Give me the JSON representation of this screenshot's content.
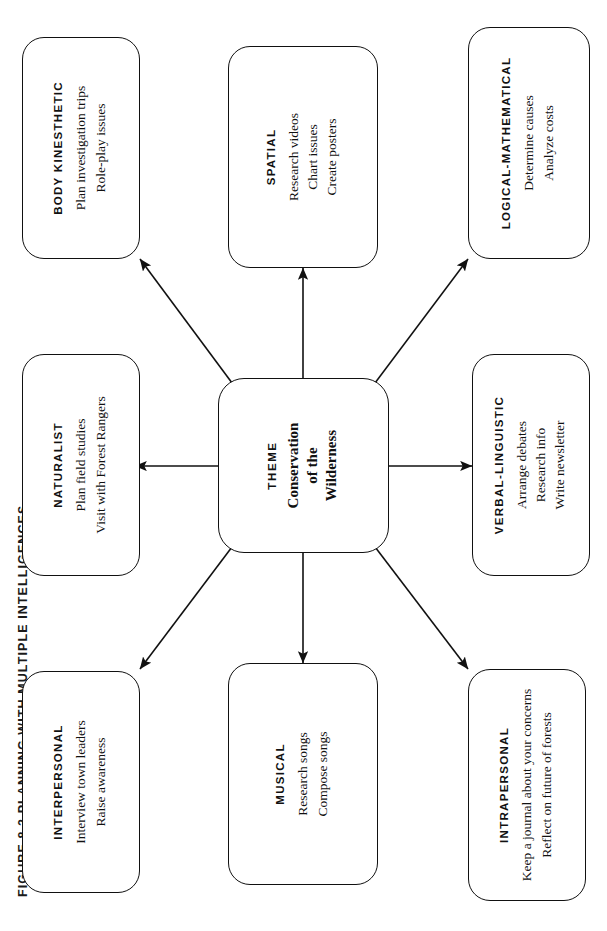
{
  "figure": {
    "title": "FIGURE 8.2  PLANNING WITH MULTIPLE INTELLIGENCES"
  },
  "theme": {
    "label": "THEME",
    "title_lines": [
      "Conservation",
      "of the",
      "Wilderness"
    ],
    "title": "Conservation of the Wilderness"
  },
  "colors": {
    "stroke": "#111111",
    "background": "#ffffff",
    "text": "#111111"
  },
  "nodes": [
    {
      "id": "intrapersonal",
      "category": "INTRAPERSONAL",
      "activities": [
        "Keep a journal about your concerns",
        "Reflect on future of forests"
      ]
    },
    {
      "id": "interpersonal",
      "category": "INTERPERSONAL",
      "activities": [
        "Interview town leaders",
        "Raise awareness"
      ]
    },
    {
      "id": "musical",
      "category": "MUSICAL",
      "activities": [
        "Research songs",
        "Compose songs"
      ]
    },
    {
      "id": "naturalist",
      "category": "NATURALIST",
      "activities": [
        "Plan field studies",
        "Visit with Forest Rangers"
      ]
    },
    {
      "id": "verbal-linguistic",
      "category": "VERBAL-LINGUISTIC",
      "activities": [
        "Arrange debates",
        "Research info",
        "Write newsletter"
      ]
    },
    {
      "id": "spatial",
      "category": "SPATIAL",
      "activities": [
        "Research videos",
        "Chart issues",
        "Create posters"
      ]
    },
    {
      "id": "logical-mathematical",
      "category": "LOGICAL-MATHEMATICAL",
      "activities": [
        "Determine causes",
        "Analyze costs"
      ]
    },
    {
      "id": "body-kinesthetic",
      "category": "BODY KINESTHETIC",
      "activities": [
        "Plan investigation trips",
        "Role-play issues"
      ]
    }
  ],
  "connectors": [
    {
      "from": "theme",
      "to": "intrapersonal",
      "style": "arrow"
    },
    {
      "from": "theme",
      "to": "interpersonal",
      "style": "arrow"
    },
    {
      "from": "theme",
      "to": "musical",
      "style": "arrow"
    },
    {
      "from": "theme",
      "to": "naturalist",
      "style": "arrow"
    },
    {
      "from": "theme",
      "to": "verbal-linguistic",
      "style": "arrow"
    },
    {
      "from": "theme",
      "to": "spatial",
      "style": "arrow"
    },
    {
      "from": "theme",
      "to": "logical-mathematical",
      "style": "arrow"
    },
    {
      "from": "theme",
      "to": "body-kinesthetic",
      "style": "arrow"
    }
  ]
}
